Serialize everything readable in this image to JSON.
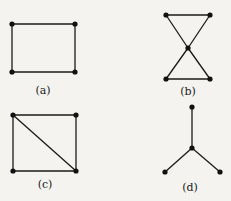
{
  "colors": {
    "background": "#f4f3f0",
    "ink": "#1a1a1a"
  },
  "graphs": [
    {
      "id": "a",
      "label": "(a)",
      "description": "4-cycle (rectangle)",
      "vertices": [
        "v1",
        "v2",
        "v3",
        "v4"
      ],
      "edges": [
        [
          "v1",
          "v2"
        ],
        [
          "v2",
          "v3"
        ],
        [
          "v3",
          "v4"
        ],
        [
          "v4",
          "v1"
        ]
      ]
    },
    {
      "id": "b",
      "label": "(b)",
      "description": "bowtie: two triangles sharing a center vertex",
      "vertices": [
        "v1",
        "v2",
        "v3",
        "v4",
        "v5"
      ],
      "edges": [
        [
          "v1",
          "v2"
        ],
        [
          "v1",
          "v3"
        ],
        [
          "v2",
          "v3"
        ],
        [
          "v3",
          "v4"
        ],
        [
          "v3",
          "v5"
        ],
        [
          "v4",
          "v5"
        ]
      ]
    },
    {
      "id": "c",
      "label": "(c)",
      "description": "4-cycle with one diagonal",
      "vertices": [
        "v1",
        "v2",
        "v3",
        "v4"
      ],
      "edges": [
        [
          "v1",
          "v2"
        ],
        [
          "v2",
          "v3"
        ],
        [
          "v3",
          "v4"
        ],
        [
          "v4",
          "v1"
        ],
        [
          "v1",
          "v3"
        ]
      ]
    },
    {
      "id": "d",
      "label": "(d)",
      "description": "star with three leaves",
      "vertices": [
        "v1",
        "v2",
        "v3",
        "v4"
      ],
      "edges": [
        [
          "v1",
          "v2"
        ],
        [
          "v2",
          "v3"
        ],
        [
          "v2",
          "v4"
        ]
      ]
    }
  ]
}
